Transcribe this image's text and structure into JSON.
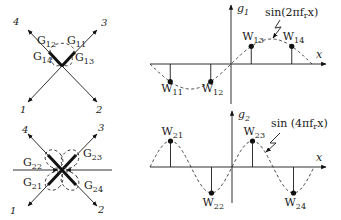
{
  "diagrams": [
    {
      "id": "cross-1",
      "port_labels": [
        "1",
        "2",
        "3",
        "4"
      ],
      "gain_labels": [
        {
          "base": "G",
          "sub": "12"
        },
        {
          "base": "G",
          "sub": "11"
        },
        {
          "base": "G",
          "sub": "14"
        },
        {
          "base": "G",
          "sub": "13"
        }
      ]
    },
    {
      "id": "cross-2",
      "port_labels": [
        "1",
        "2",
        "3",
        "4"
      ],
      "gain_labels": [
        {
          "base": "G",
          "sub": "22"
        },
        {
          "base": "G",
          "sub": "23"
        },
        {
          "base": "G",
          "sub": "21"
        },
        {
          "base": "G",
          "sub": "24"
        }
      ]
    }
  ],
  "chart_data": [
    {
      "type": "line",
      "title": "",
      "ylabel": {
        "base": "g",
        "sub": "1"
      },
      "xlabel": "x",
      "annotation": "sin(2πf",
      "annotation_sub": "r",
      "annotation_tail": "x)",
      "function": "sin(2*pi*f_r*x)",
      "cycles_per_axis": 1,
      "x_range": [
        -1,
        1
      ],
      "y_range": [
        -1,
        1
      ],
      "samples": [
        {
          "label": "W",
          "sub": "11",
          "x": -0.75,
          "y": -0.707
        },
        {
          "label": "W",
          "sub": "12",
          "x": -0.25,
          "y": -0.707
        },
        {
          "label": "W",
          "sub": "13",
          "x": 0.25,
          "y": 0.707
        },
        {
          "label": "W",
          "sub": "14",
          "x": 0.75,
          "y": 0.707
        }
      ]
    },
    {
      "type": "line",
      "title": "",
      "ylabel": {
        "base": "g",
        "sub": "2"
      },
      "xlabel": "x",
      "annotation": "sin (4πf",
      "annotation_sub": "r",
      "annotation_tail": "x)",
      "function": "sin(4*pi*f_r*x)",
      "cycles_per_axis": 2,
      "x_range": [
        -1,
        1
      ],
      "y_range": [
        -1,
        1
      ],
      "samples": [
        {
          "label": "W",
          "sub": "21",
          "x": -0.75,
          "y": 1
        },
        {
          "label": "W",
          "sub": "22",
          "x": -0.25,
          "y": -1
        },
        {
          "label": "W",
          "sub": "23",
          "x": 0.25,
          "y": 1
        },
        {
          "label": "W",
          "sub": "24",
          "x": 0.75,
          "y": -1
        }
      ]
    }
  ]
}
